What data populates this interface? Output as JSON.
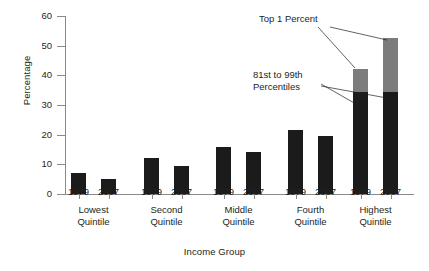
{
  "chart_data": {
    "type": "bar",
    "title": "",
    "xlabel": "Income Group",
    "ylabel": "Percentage",
    "ylim": [
      0,
      60
    ],
    "yticks": [
      0,
      10,
      20,
      30,
      40,
      50,
      60
    ],
    "grid": false,
    "legend": "none",
    "categories": [
      "Lowest Quintile",
      "Second Quintile",
      "Middle Quintile",
      "Fourth Quintile",
      "Highest Quintile"
    ],
    "subcategories": [
      "1979",
      "2007"
    ],
    "series": [
      {
        "name": "1979",
        "values": [
          7,
          12,
          16,
          21.5,
          42
        ]
      },
      {
        "name": "2007",
        "values": [
          5,
          9.5,
          14,
          19.5,
          52.5
        ]
      }
    ],
    "stacked_segments": {
      "note": "Highest Quintile bars are stacked",
      "lower_label": "81st to 99th Percentiles",
      "upper_label": "Top 1 Percent",
      "1979": {
        "lower": 34.5,
        "upper": 7.5,
        "total": 42
      },
      "2007": {
        "lower": 34.5,
        "upper": 18,
        "total": 52.5
      }
    },
    "annotations": [
      {
        "text": "Top 1 Percent",
        "target": "upper gray segments"
      },
      {
        "text": "81st to 99th",
        "target": "lower dark segments"
      },
      {
        "text": "Percentiles",
        "target": "lower dark segments"
      }
    ],
    "colors": {
      "bar_dark": "#1b1b1b",
      "bar_gray": "#7c7c7c",
      "axis": "#8a8a8a",
      "text": "#231f20",
      "background": "#ffffff"
    }
  },
  "axes": {
    "y_title": "Percentage",
    "x_title": "Income Group",
    "y_tick_labels": [
      "60",
      "50",
      "40",
      "30",
      "20",
      "10",
      "0"
    ]
  },
  "groups": [
    {
      "label_line1": "Lowest",
      "label_line2": "Quintile",
      "bars": [
        {
          "year": "1979",
          "value": 7
        },
        {
          "year": "2007",
          "value": 5
        }
      ]
    },
    {
      "label_line1": "Second",
      "label_line2": "Quintile",
      "bars": [
        {
          "year": "1979",
          "value": 12
        },
        {
          "year": "2007",
          "value": 9.5
        }
      ]
    },
    {
      "label_line1": "Middle",
      "label_line2": "Quintile",
      "bars": [
        {
          "year": "1979",
          "value": 16
        },
        {
          "year": "2007",
          "value": 14
        }
      ]
    },
    {
      "label_line1": "Fourth",
      "label_line2": "Quintile",
      "bars": [
        {
          "year": "1979",
          "value": 21.5
        },
        {
          "year": "2007",
          "value": 19.5
        }
      ]
    },
    {
      "label_line1": "Highest",
      "label_line2": "Quintile",
      "bars": [
        {
          "year": "1979",
          "value": 42,
          "lower": 34.5,
          "upper": 7.5
        },
        {
          "year": "2007",
          "value": 52.5,
          "lower": 34.5,
          "upper": 18
        }
      ]
    }
  ],
  "annotations": {
    "top_one_percent": "Top 1 Percent",
    "percentiles_line1": "81st to 99th",
    "percentiles_line2": "Percentiles"
  }
}
